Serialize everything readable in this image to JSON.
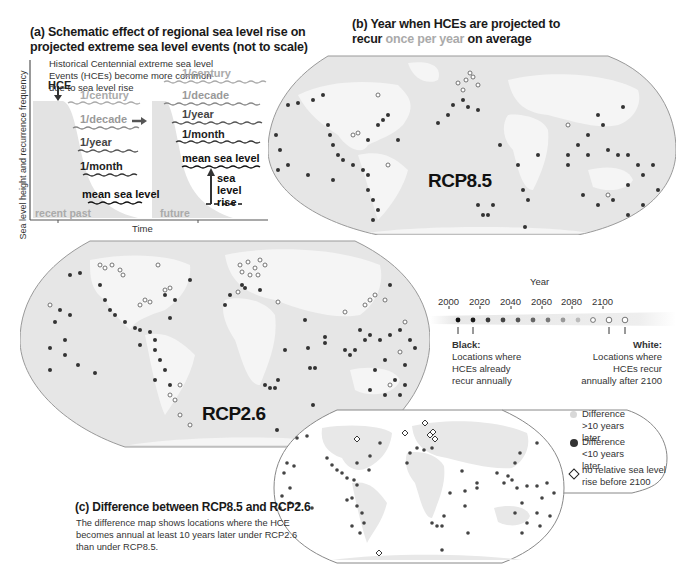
{
  "panel_a": {
    "title_line1": "(a) Schematic effect of regional sea level rise on",
    "title_line2": "projected extreme sea level events (not to scale)",
    "note_line1": "Historical Centennial extreme sea level",
    "note_line2": "Events (HCEs) become more common",
    "note_line3": "due to sea level rise",
    "y_axis_label": "Sea level height and recurrence frequency",
    "x_axis_label": "Time",
    "hce_label": "HCE",
    "left_levels": [
      "1/century",
      "1/decade",
      "1/year",
      "1/month",
      "mean sea level"
    ],
    "right_levels": [
      "1/century",
      "1/decade",
      "1/year",
      "1/month",
      "mean sea level"
    ],
    "left_period": "recent past",
    "right_period": "future",
    "rise_label_1": "sea",
    "rise_label_2": "level",
    "rise_label_3": "rise"
  },
  "panel_b": {
    "title_line1": "(b) Year when HCEs are projected to",
    "title_line2_a": "recur ",
    "title_line2_b": "once per year",
    "title_line2_c": " on average",
    "map_top_label": "RCP8.5",
    "map_bottom_label": "RCP2.6"
  },
  "year_legend": {
    "title": "Year",
    "ticks": [
      "2000",
      "2020",
      "2040",
      "2060",
      "2080",
      "2100"
    ],
    "dot_colors": [
      "#111111",
      "#1a1a1a",
      "#3a3a3a",
      "#454545",
      "#555555",
      "#666666",
      "#7a7a7a",
      "#999999",
      "#bbbbbb",
      "#ffffff",
      "#ffffff",
      "#ffffff"
    ],
    "black_heading": "Black:",
    "black_text_1": "Locations where",
    "black_text_2": "HCEs already",
    "black_text_3": "recur annually",
    "white_heading": "White:",
    "white_text_1": "Locations where",
    "white_text_2": "HCEs recur",
    "white_text_3": "annually after 2100"
  },
  "panel_c": {
    "title": "(c) Difference between RCP8.5 and RCP2.6",
    "desc_line1": "The difference map shows locations where the HCE",
    "desc_line2": "becomes annual at least 10 years later under RCP2.6",
    "desc_line3": "than under RCP8.5.",
    "legend": [
      {
        "symbol": "light-dot",
        "line1": "Difference",
        "line2": ">10 years later"
      },
      {
        "symbol": "dark-dot",
        "line1": "Difference",
        "line2": "<10 years later"
      },
      {
        "symbol": "diamond",
        "line1": "no relative sea level",
        "line2": "rise before 2100"
      }
    ]
  },
  "colors": {
    "land": "#f2f2f2",
    "ocean": "#e3e3e3",
    "map_border": "#8a8a8a",
    "dark_dot": "#333333",
    "light_dot": "#d6d6d6",
    "grey_label": "#a8a8a8"
  }
}
